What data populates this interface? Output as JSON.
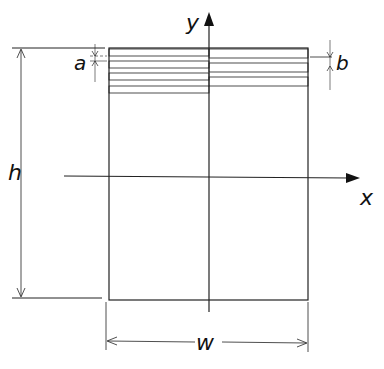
{
  "diagram": {
    "labels": {
      "y_axis": "y",
      "x_axis": "x",
      "height": "h",
      "width": "w",
      "layer_gap": "a",
      "layer_thickness": "b"
    },
    "colors": {
      "line": "#222222",
      "stripe_fill": "#d6d6d6",
      "background": "#ffffff"
    },
    "stripes": {
      "left_count": 4,
      "right_count": 3
    }
  }
}
